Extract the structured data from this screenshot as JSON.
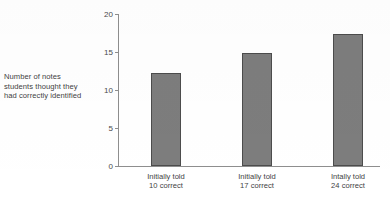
{
  "chart_data": {
    "type": "bar",
    "title": "",
    "subtitle": "",
    "xlabel": "",
    "ylabel": "Number of notes students thought they had correctly identified",
    "ylabel_lines": [
      "Number of notes",
      "students thought they",
      "had correctly identified"
    ],
    "categories": [
      "Initially told 10 correct",
      "Initially told 17 correct",
      "Intally told 24 correct"
    ],
    "category_lines": [
      [
        "Initially told",
        "10 correct"
      ],
      [
        "Initially told",
        "17 correct"
      ],
      [
        "Intally told",
        "24 correct"
      ]
    ],
    "values": [
      12.2,
      14.9,
      17.4
    ],
    "ylim": [
      0,
      20
    ],
    "yticks": [
      0,
      5,
      10,
      15,
      20
    ],
    "ytick_labels": [
      "0",
      "5",
      "10",
      "15",
      "20"
    ],
    "grid": false,
    "legend": false,
    "legend_position": "none",
    "bar_fill_color": "#7d7d7d",
    "bar_edge_color": "#4c4c4c",
    "axis_color": "#8e8e8e",
    "text_color": "#3f3f3f",
    "background_color": "#ffffff"
  }
}
